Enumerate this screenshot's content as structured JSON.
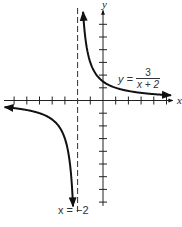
{
  "chart_data": {
    "type": "line",
    "title": "",
    "function": "y = 3/(x+2)",
    "equation_label": {
      "lhs": "y =",
      "numerator": "3",
      "denominator": "x + 2"
    },
    "asymptote_label": "x = −2",
    "xlabel": "x",
    "ylabel": "y",
    "vertical_asymptote": -2,
    "horizontal_asymptote": 0,
    "xlim": [
      -7.8,
      5.5
    ],
    "ylim": [
      -8.3,
      7.1
    ],
    "x_ticks": [
      -7,
      -6,
      -5,
      -4,
      -3,
      -2,
      -1,
      1,
      2,
      3,
      4,
      5
    ],
    "y_ticks": [
      -8,
      -7,
      -6,
      -5,
      -4,
      -3,
      -2,
      -1,
      1,
      2,
      3,
      4,
      5,
      6
    ],
    "grid": false,
    "legend": null,
    "series": [
      {
        "name": "right branch",
        "x": [
          -1.55,
          -1.5,
          -1.25,
          -1,
          -0.5,
          0,
          1,
          2,
          3,
          4,
          5
        ],
        "y": [
          6.67,
          6,
          4,
          3,
          2,
          1.5,
          1,
          0.75,
          0.6,
          0.5,
          0.43
        ]
      },
      {
        "name": "left branch",
        "x": [
          -7.8,
          -7,
          -6,
          -5,
          -4,
          -3,
          -2.5,
          -2.4
        ],
        "y": [
          -0.52,
          -0.6,
          -0.75,
          -1,
          -1.5,
          -3,
          -6,
          -7.5
        ]
      }
    ]
  },
  "labels": {
    "x_axis": "x",
    "y_axis": "y",
    "eq_lhs": "y =",
    "eq_num": "3",
    "eq_den": "x + 2",
    "asymptote": "x = −2"
  },
  "geometry": {
    "origin_px": [
      103,
      100.5
    ],
    "unit_px": 12.7
  }
}
